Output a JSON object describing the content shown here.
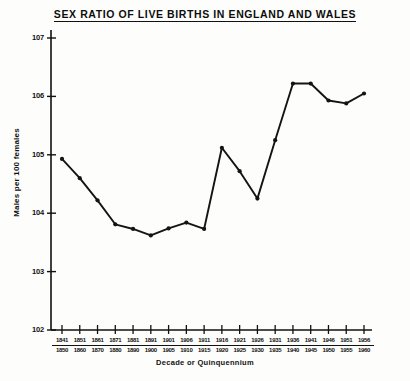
{
  "title": "SEX RATIO OF LIVE BIRTHS IN ENGLAND AND WALES",
  "axis": {
    "ylabel": "Males per 100 females",
    "xlabel": "Decade or Quinquennium"
  },
  "chart_data": {
    "type": "line",
    "title": "SEX RATIO OF LIVE BIRTHS IN ENGLAND AND WALES",
    "xlabel": "Decade or Quinquennium",
    "ylabel": "Males per 100 females",
    "ylim": [
      102,
      107
    ],
    "yticks": [
      102,
      103,
      104,
      105,
      106,
      107
    ],
    "ytick_labels": [
      "102",
      "103",
      "104",
      "105",
      "106",
      "107"
    ],
    "grid": false,
    "legend": null,
    "marker": "filled-circle",
    "line_color": "#141414",
    "categories": [
      {
        "start": "1841",
        "end": "1850"
      },
      {
        "start": "1851",
        "end": "1860"
      },
      {
        "start": "1861",
        "end": "1870"
      },
      {
        "start": "1871",
        "end": "1880"
      },
      {
        "start": "1881",
        "end": "1890"
      },
      {
        "start": "1891",
        "end": "1900"
      },
      {
        "start": "1901",
        "end": "1905"
      },
      {
        "start": "1906",
        "end": "1910"
      },
      {
        "start": "1911",
        "end": "1915"
      },
      {
        "start": "1916",
        "end": "1920"
      },
      {
        "start": "1921",
        "end": "1925"
      },
      {
        "start": "1926",
        "end": "1930"
      },
      {
        "start": "1931",
        "end": "1935"
      },
      {
        "start": "1936",
        "end": "1940"
      },
      {
        "start": "1941",
        "end": "1945"
      },
      {
        "start": "1946",
        "end": "1950"
      },
      {
        "start": "1951",
        "end": "1955"
      },
      {
        "start": "1956",
        "end": "1960"
      }
    ],
    "values": [
      104.93,
      104.6,
      104.22,
      103.81,
      103.73,
      103.62,
      103.74,
      103.84,
      103.73,
      105.12,
      104.72,
      104.25,
      105.25,
      106.22,
      106.22,
      105.93,
      105.88,
      106.05
    ]
  }
}
